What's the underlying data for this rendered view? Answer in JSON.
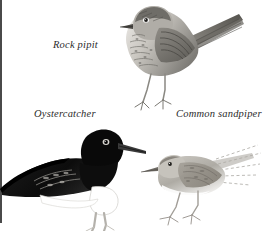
{
  "plate": {
    "kind": "bird-illustration-plate",
    "medium": "pencil and grey wash drawing",
    "background_color": "#ffffff",
    "border": {
      "edge": "left",
      "color": "#4a4a4a",
      "width_px": 2
    },
    "width_px": 263,
    "height_px": 231
  },
  "captions": {
    "rock_pipit": "Rock pipit",
    "oystercatcher": "Oystercatcher",
    "common_sandpiper": "Common sandpiper"
  },
  "birds": [
    {
      "id": "rock-pipit",
      "label": "Rock pipit",
      "facing": "left",
      "posture": "perched, upright, legs extended below",
      "plumage": "heavily streaked buff-grey breast and flanks, darker streaked upperparts",
      "tone": "mid grey",
      "colors": {
        "body": "#9a9a96",
        "dark": "#5d5d5a",
        "light": "#e6e4e0"
      }
    },
    {
      "id": "oystercatcher",
      "label": "Oystercatcher",
      "facing": "right",
      "posture": "standing in profile, long straight bill, pale legs",
      "plumage": "blackish head, breast and upperparts with clean white underparts",
      "tone": "near black and white",
      "colors": {
        "body": "#161616",
        "dark": "#000000",
        "light": "#ffffff"
      }
    },
    {
      "id": "common-sandpiper",
      "label": "Common sandpiper",
      "facing": "left",
      "posture": "crouched, horizontal, long tail sketched with dashed strokes",
      "plumage": "pale brownish-grey upperparts, white underparts, faint sketchy wing and tail lines",
      "tone": "light grey",
      "colors": {
        "body": "#b9b6b0",
        "dark": "#8b8880",
        "light": "#f4f3f1"
      }
    }
  ]
}
